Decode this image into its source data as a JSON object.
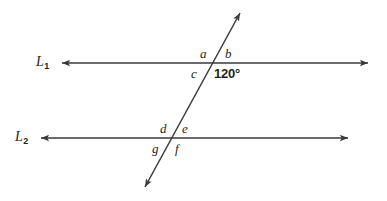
{
  "figure": {
    "background_color": "#ffffff",
    "stroke_color": "#3a3a3a",
    "text_color": "#231f20",
    "width": 387,
    "height": 201
  },
  "lines": {
    "l1": {
      "name": "L",
      "subscript": "1",
      "label_text": "L",
      "y": 63,
      "x_start": 62,
      "x_end": 368,
      "arrows": "both"
    },
    "l2": {
      "name": "L",
      "subscript": "2",
      "label_text": "L",
      "y": 138,
      "x_start": 41,
      "x_end": 348,
      "arrows": "both"
    },
    "transversal": {
      "name": "transversal",
      "x_start": 145,
      "y_start": 187,
      "x_end": 240,
      "y_end": 13,
      "arrows": "both"
    }
  },
  "intersections": {
    "upper": {
      "x": 213,
      "y": 63
    },
    "lower": {
      "x": 173,
      "y": 138
    }
  },
  "angles": {
    "a": {
      "label": "a",
      "x": 200,
      "y": 47
    },
    "b": {
      "label": "b",
      "x": 225,
      "y": 47
    },
    "c": {
      "label": "c",
      "x": 191,
      "y": 67
    },
    "d": {
      "label": "d",
      "x": 160,
      "y": 122
    },
    "e": {
      "label": "e",
      "x": 182,
      "y": 122
    },
    "g": {
      "label": "g",
      "x": 152,
      "y": 142
    },
    "f": {
      "label": "f",
      "x": 175,
      "y": 142
    },
    "known": {
      "label": "120°",
      "x": 214,
      "y": 67
    }
  }
}
